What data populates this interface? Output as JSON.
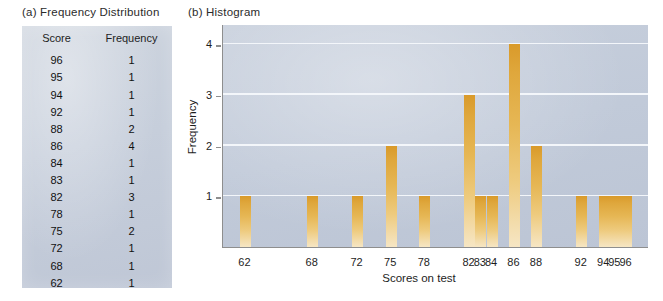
{
  "panels": {
    "a_caption": "(a) Frequency Distribution",
    "b_caption": "(b) Histogram"
  },
  "table": {
    "headers": [
      "Score",
      "Frequency"
    ],
    "rows": [
      [
        "96",
        "1"
      ],
      [
        "95",
        "1"
      ],
      [
        "94",
        "1"
      ],
      [
        "92",
        "1"
      ],
      [
        "88",
        "2"
      ],
      [
        "86",
        "4"
      ],
      [
        "84",
        "1"
      ],
      [
        "83",
        "1"
      ],
      [
        "82",
        "3"
      ],
      [
        "78",
        "1"
      ],
      [
        "75",
        "2"
      ],
      [
        "72",
        "1"
      ],
      [
        "68",
        "1"
      ],
      [
        "62",
        "1"
      ]
    ]
  },
  "chart_data": {
    "type": "bar",
    "title": "Histogram",
    "xlabel": "Scores on test",
    "ylabel": "Frequency",
    "categories": [
      "62",
      "68",
      "72",
      "75",
      "78",
      "82",
      "83",
      "84",
      "86",
      "88",
      "92",
      "94",
      "95",
      "96"
    ],
    "values": [
      1,
      1,
      1,
      2,
      1,
      3,
      1,
      1,
      4,
      2,
      1,
      1,
      1,
      1
    ],
    "x_numeric": [
      62,
      68,
      72,
      75,
      78,
      82,
      83,
      84,
      86,
      88,
      92,
      94,
      95,
      96
    ],
    "xlim": [
      60,
      98
    ],
    "ylim": [
      0,
      4.4
    ],
    "y_ticks": [
      "1",
      "2",
      "3",
      "4"
    ],
    "y_tick_values": [
      1,
      2,
      3,
      4
    ],
    "grid": "horizontal",
    "legend": "none",
    "colors": {
      "bar_top": "#d99a2a",
      "bar_bottom": "#f6e6c4",
      "plot_background": "#c1cad9",
      "gridline": "#f3f6fa",
      "axis": "#8e8e8e",
      "table_background": "#c6cedb",
      "text": "#1d1d1d"
    }
  }
}
